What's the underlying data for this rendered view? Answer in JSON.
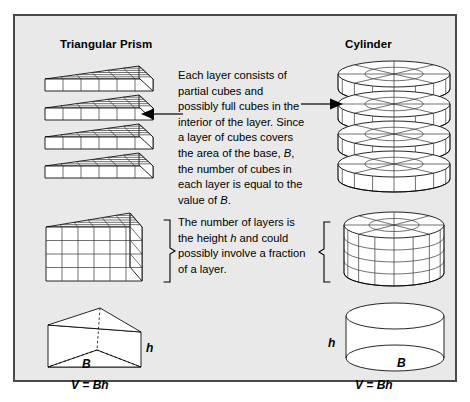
{
  "panel": {
    "background_color": "#e9e9e9",
    "border_color": "#4a4a4a"
  },
  "columns": {
    "left": {
      "title": "Triangular Prism"
    },
    "right": {
      "title": "Cylinder"
    }
  },
  "explanations": {
    "layers_paragraph_part1": "Each layer consists of partial cubes and possibly full cubes in the interior of the layer. Since a layer of cubes covers the area of the base, ",
    "layers_paragraph_var1": "B",
    "layers_paragraph_part2": ", the number of cubes in each layer is equal to the value of ",
    "layers_paragraph_var2": "B",
    "layers_paragraph_part3": ".",
    "height_paragraph_part1": "The number of layers is the height ",
    "height_paragraph_var": "h",
    "height_paragraph_part2": " and could possibly involve a fraction of a layer."
  },
  "figures": {
    "prism_stack": {
      "name": "Exploded triangular prism layers",
      "layer_count": 4,
      "columns_per_layer": 6
    },
    "cylinder_stack": {
      "name": "Exploded cylinder disk layers",
      "layer_count": 4,
      "columns_per_layer": 8
    },
    "prism_assembled": {
      "name": "Assembled triangular prism of cubes",
      "rows": 4,
      "columns": 6
    },
    "cylinder_assembled": {
      "name": "Assembled cylinder of cubes",
      "rows": 4,
      "columns": 8
    }
  },
  "labels": {
    "prism_height": "h",
    "prism_base": "B",
    "cylinder_height": "h",
    "cylinder_base": "B"
  },
  "formulas": {
    "prism": "V = Bh",
    "cylinder": "V = Bh"
  },
  "icons": {
    "arrow_left": "arrow-left-icon",
    "arrow_right": "arrow-right-icon",
    "brace_right": "curly-brace-icon",
    "brace_left": "curly-brace-icon"
  }
}
